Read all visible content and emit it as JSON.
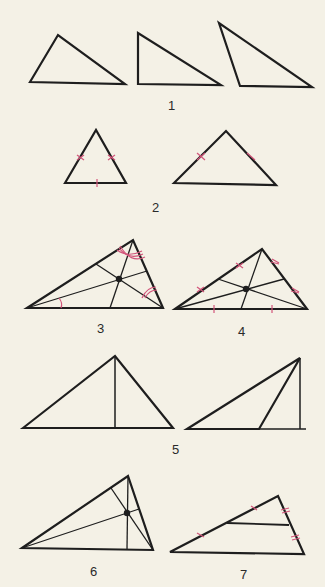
{
  "colors": {
    "background": "#f4f1e6",
    "line": "#1e1e1e",
    "mark": "#d2557a"
  },
  "figures": [
    {
      "id": "1",
      "label": "1",
      "description": "Three triangles: acute, right, obtuse"
    },
    {
      "id": "2",
      "label": "2",
      "description": "Equilateral and isosceles triangles with tick marks on equal sides"
    },
    {
      "id": "3",
      "label": "3",
      "description": "Triangle with angle bisectors meeting at incenter"
    },
    {
      "id": "4",
      "label": "4",
      "description": "Triangle with medians meeting at centroid"
    },
    {
      "id": "5",
      "label": "5",
      "description": "Altitudes of acute and obtuse triangles"
    },
    {
      "id": "6",
      "label": "6",
      "description": "Triangle with altitude, median, and bisector from vertices"
    },
    {
      "id": "7",
      "label": "7",
      "description": "Triangle midline connecting midpoints of two sides"
    }
  ]
}
